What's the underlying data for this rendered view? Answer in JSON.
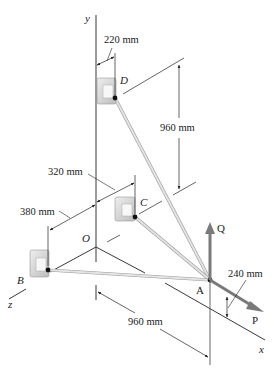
{
  "diagram": {
    "type": "3d-statics-figure",
    "axes": {
      "x": "x",
      "y": "y",
      "z": "z",
      "origin": "O"
    },
    "points": {
      "A": "A",
      "B": "B",
      "C": "C",
      "D": "D"
    },
    "forces": {
      "Q": "Q",
      "P": "P"
    },
    "dimensions": {
      "d_220": "220 mm",
      "d_960_vertical": "960 mm",
      "d_320": "320 mm",
      "d_380": "380 mm",
      "d_960_x": "960 mm",
      "d_240": "240 mm"
    },
    "colors": {
      "line": "#222222",
      "cable": "#d8d8d8",
      "cable_edge": "#9a9a9a",
      "force_arrow": "#7a7a7a",
      "support": "#cfcfcf"
    }
  }
}
